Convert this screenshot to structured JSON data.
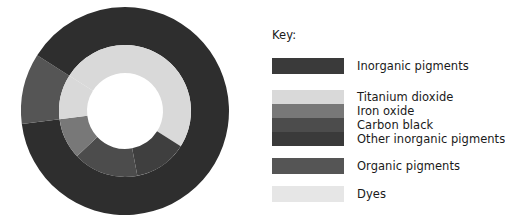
{
  "legend": {
    "title": "Key:",
    "groups": [
      {
        "name": "inorganic",
        "type": "solid",
        "color": "#3a3a3a",
        "labels": [
          "Inorganic pigments"
        ]
      },
      {
        "name": "inorganic-breakdown",
        "type": "stack",
        "colors": [
          "#d9d9d9",
          "#787878",
          "#4c4c4c",
          "#3a3a3a"
        ],
        "labels": [
          "Titanium dioxide",
          "Iron oxide",
          "Carbon black",
          "Other inorganic pigments"
        ]
      },
      {
        "name": "organic",
        "type": "solid",
        "color": "#555555",
        "labels": [
          "Organic pigments"
        ]
      },
      {
        "name": "dyes",
        "type": "solid",
        "color": "#e6e6e6",
        "labels": [
          "Dyes"
        ]
      }
    ]
  },
  "chart_data": {
    "type": "pie",
    "title": "",
    "subtitle": "",
    "xlabel": "",
    "ylabel": "",
    "legend_position": "right",
    "grid": false,
    "variant": "donut-two-ring",
    "rings": [
      {
        "name": "outer",
        "inner_radius_px": 66,
        "outer_radius_px": 104,
        "start_angle_deg": 0,
        "direction": "clockwise",
        "categories": [
          "Inorganic pigments",
          "Organic pigments",
          "Dyes"
        ],
        "values": [
          73,
          11,
          16
        ],
        "colors": [
          "#2e2e2e",
          "#555555",
          "#2e2e2e"
        ],
        "note": "Outer ring renders Inorganic, Organic and Dyes all in the same dark tone"
      },
      {
        "name": "inner",
        "inner_radius_px": 38,
        "outer_radius_px": 66,
        "start_angle_deg": 0,
        "direction": "clockwise",
        "categories": [
          "Titanium dioxide",
          "Iron oxide",
          "Carbon black",
          "Other inorganic pigments",
          "Organic pigments",
          "Dyes"
        ],
        "values": [
          34,
          13,
          16,
          10,
          11,
          16
        ],
        "colors": [
          "#d9d9d9",
          "#3f3f3f",
          "#4c4c4c",
          "#787878",
          "#d9d9d9",
          "#d9d9d9"
        ]
      }
    ]
  }
}
